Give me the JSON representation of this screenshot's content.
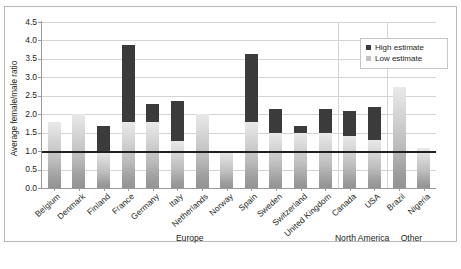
{
  "caption_strip": "",
  "chart_data": {
    "type": "bar",
    "title": "",
    "xlabel": "",
    "ylabel": "Average female/male ratio",
    "ylim": [
      0.0,
      4.5
    ],
    "ytick_step": 0.5,
    "yticks": [
      "4.5",
      "4.0",
      "3.5",
      "3.0",
      "2.5",
      "2.0",
      "1.5",
      "1.0",
      "0.5",
      "0.0"
    ],
    "grid": true,
    "reference_line": 1.0,
    "legend_position": "top-right",
    "legend": [
      {
        "key": "high",
        "label": "High estimate",
        "color": "#3b3b3b"
      },
      {
        "key": "low",
        "label": "Low estimate",
        "color": "#c2c2c2"
      }
    ],
    "categories": [
      "Belgium",
      "Denmark",
      "Finland",
      "France",
      "Germany",
      "Italy",
      "Netherlands",
      "Norway",
      "Spain",
      "Sweden",
      "Switzerland",
      "United Kingdom",
      "Canada",
      "USA",
      "Brazil",
      "Nigeria"
    ],
    "series": [
      {
        "name": "Low estimate",
        "values": [
          1.78,
          2.0,
          1.0,
          1.8,
          1.8,
          1.27,
          2.0,
          1.0,
          1.8,
          1.5,
          1.5,
          1.48,
          1.42,
          1.3,
          2.73,
          1.08
        ]
      },
      {
        "name": "High estimate",
        "values": [
          1.78,
          2.0,
          1.67,
          3.87,
          2.28,
          2.37,
          2.0,
          1.0,
          3.63,
          2.15,
          1.68,
          2.13,
          2.08,
          2.2,
          2.73,
          1.08
        ]
      }
    ],
    "groups": [
      {
        "label": "Europe",
        "start": 0,
        "end": 11
      },
      {
        "label": "North America",
        "start": 12,
        "end": 13
      },
      {
        "label": "Other",
        "start": 14,
        "end": 15
      }
    ]
  }
}
